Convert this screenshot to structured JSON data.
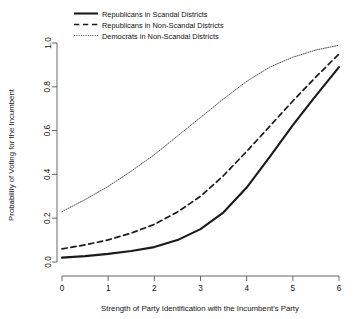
{
  "chart_data": {
    "type": "line",
    "title": "",
    "xlabel": "Strength of Party Identification with the Incumbent's Party",
    "ylabel": "Probability of Voting for the Incumbent",
    "xlim": [
      0,
      6
    ],
    "ylim": [
      0,
      1
    ],
    "xticks": [
      0,
      1,
      2,
      3,
      4,
      5,
      6
    ],
    "xticklabels": [
      "0",
      "1",
      "2",
      "3",
      "4",
      "5",
      "6"
    ],
    "yticks": [
      0.0,
      0.2,
      0.4,
      0.6,
      0.8,
      1.0
    ],
    "yticklabels": [
      "0.0",
      "0.2",
      "0.4",
      "0.6",
      "0.8",
      "1.0"
    ],
    "grid": false,
    "legend_position": "top-left",
    "x": [
      0,
      0.5,
      1,
      1.5,
      2,
      2.5,
      3,
      3.5,
      4,
      4.5,
      5,
      5.5,
      6
    ],
    "series": [
      {
        "name": "Republicans in Scandal Districts",
        "style": "solid",
        "color": "#1a1a1a",
        "width": 2.1,
        "values": [
          0.02,
          0.027,
          0.037,
          0.05,
          0.068,
          0.1,
          0.15,
          0.227,
          0.34,
          0.48,
          0.625,
          0.76,
          0.89
        ]
      },
      {
        "name": "Republicans in Non-Scandal Districts",
        "style": "dashed",
        "color": "#1a1a1a",
        "width": 1.7,
        "values": [
          0.06,
          0.078,
          0.101,
          0.132,
          0.172,
          0.228,
          0.3,
          0.395,
          0.505,
          0.62,
          0.735,
          0.845,
          0.95
        ]
      },
      {
        "name": "Democrats in Non-Scandal Districts",
        "style": "dotted",
        "color": "#555555",
        "width": 1.0,
        "values": [
          0.23,
          0.285,
          0.345,
          0.415,
          0.49,
          0.575,
          0.66,
          0.745,
          0.825,
          0.89,
          0.935,
          0.968,
          0.99
        ]
      }
    ]
  },
  "legend": {
    "items": [
      "Republicans in Scandal Districts",
      "Republicans in Non-Scandal Districts",
      "Democrats in Non-Scandal Districts"
    ]
  }
}
